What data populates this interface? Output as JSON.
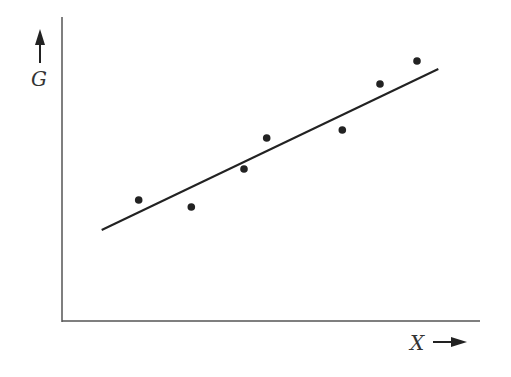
{
  "chart_data": {
    "type": "scatter",
    "title": "",
    "xlabel": "X",
    "ylabel": "G",
    "grid": false,
    "legend": null,
    "axis_arrows": {
      "x": "right-arrow",
      "y": "up-arrow"
    },
    "points": [
      {
        "x": 138.7,
        "y": 200
      },
      {
        "x": 191.3,
        "y": 207
      },
      {
        "x": 244.0,
        "y": 169
      },
      {
        "x": 266.7,
        "y": 138
      },
      {
        "x": 342.3,
        "y": 130
      },
      {
        "x": 380.0,
        "y": 84
      },
      {
        "x": 417.0,
        "y": 61
      }
    ],
    "trend_line": {
      "x1": 101.7,
      "y1": 230,
      "x2": 438.3,
      "y2": 69
    },
    "note": "No numeric ticks; coordinates are pixel positions. Data shows positive linear relationship of G vs X with best-fit line."
  },
  "labels": {
    "x": "X",
    "y": "G"
  },
  "colors": {
    "axis": "#555555",
    "point": "#222222",
    "line": "#222222"
  }
}
